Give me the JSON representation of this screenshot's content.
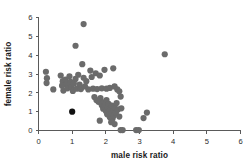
{
  "chart_data": {
    "type": "scatter",
    "title": "",
    "xlabel": "male risk ratio",
    "ylabel": "female risk ratio",
    "xlim": [
      0,
      6
    ],
    "ylim": [
      0,
      6
    ],
    "xticks": [
      0,
      1,
      2,
      3,
      4,
      5,
      6
    ],
    "yticks": [
      0,
      1,
      2,
      3,
      4,
      5,
      6
    ],
    "xtick_labels": [
      "0",
      "1",
      "2",
      "3",
      "4",
      "5",
      "6"
    ],
    "ytick_labels": [
      "0",
      "1",
      "2",
      "3",
      "4",
      "5",
      "6"
    ],
    "grid": false,
    "legend": null,
    "marker_color": "#6b6b6b",
    "highlight_color": "#111111",
    "marker_size": 3.1,
    "axis_color": "#5a5a5a",
    "series": [
      {
        "name": "studies",
        "color": "#6b6b6b",
        "points": [
          [
            0.22,
            3.12
          ],
          [
            0.25,
            2.78
          ],
          [
            0.24,
            2.52
          ],
          [
            0.44,
            2.18
          ],
          [
            0.66,
            2.92
          ],
          [
            0.72,
            2.62
          ],
          [
            0.7,
            2.38
          ],
          [
            0.74,
            2.12
          ],
          [
            0.8,
            2.7
          ],
          [
            0.84,
            2.46
          ],
          [
            0.86,
            2.24
          ],
          [
            0.92,
            2.88
          ],
          [
            0.95,
            2.58
          ],
          [
            0.98,
            2.3
          ],
          [
            1.02,
            2.1
          ],
          [
            1.05,
            2.5
          ],
          [
            1.1,
            2.74
          ],
          [
            1.14,
            2.22
          ],
          [
            1.18,
            2.96
          ],
          [
            1.22,
            2.44
          ],
          [
            1.26,
            2.2
          ],
          [
            1.3,
            3.52
          ],
          [
            1.34,
            2.8
          ],
          [
            1.38,
            2.34
          ],
          [
            1.42,
            2.62
          ],
          [
            1.48,
            2.18
          ],
          [
            1.54,
            3.18
          ],
          [
            1.58,
            2.84
          ],
          [
            1.62,
            2.22
          ],
          [
            1.7,
            3.04
          ],
          [
            1.74,
            2.2
          ],
          [
            1.82,
            2.92
          ],
          [
            1.88,
            2.24
          ],
          [
            1.96,
            3.22
          ],
          [
            2.02,
            2.22
          ],
          [
            2.12,
            2.26
          ],
          [
            2.22,
            3.3
          ],
          [
            2.26,
            2.34
          ],
          [
            2.34,
            2.18
          ],
          [
            2.4,
            2.08
          ],
          [
            1.66,
            1.78
          ],
          [
            1.72,
            1.62
          ],
          [
            1.78,
            1.52
          ],
          [
            1.84,
            1.72
          ],
          [
            1.88,
            1.34
          ],
          [
            1.92,
            1.16
          ],
          [
            1.94,
            1.5
          ],
          [
            1.98,
            1.3
          ],
          [
            2.0,
            1.04
          ],
          [
            2.02,
            1.62
          ],
          [
            2.04,
            0.86
          ],
          [
            2.06,
            1.22
          ],
          [
            2.08,
            1.42
          ],
          [
            2.1,
            0.96
          ],
          [
            2.12,
            0.7
          ],
          [
            2.14,
            1.1
          ],
          [
            2.16,
            0.88
          ],
          [
            2.18,
            1.32
          ],
          [
            2.2,
            0.62
          ],
          [
            2.22,
            1.02
          ],
          [
            2.24,
            0.8
          ],
          [
            2.26,
            1.2
          ],
          [
            2.3,
            0.94
          ],
          [
            2.32,
            1.46
          ],
          [
            2.36,
            1.12
          ],
          [
            2.4,
            0.74
          ],
          [
            1.82,
            0.52
          ],
          [
            2.16,
            0.44
          ],
          [
            2.26,
            0.34
          ],
          [
            2.44,
            1.8
          ],
          [
            2.46,
            1.18
          ],
          [
            2.44,
            0.02
          ],
          [
            2.5,
            0.02
          ],
          [
            2.9,
            0.02
          ],
          [
            2.98,
            0.02
          ],
          [
            3.12,
            0.66
          ],
          [
            3.22,
            0.95
          ],
          [
            1.1,
            4.5
          ],
          [
            1.34,
            5.65
          ],
          [
            3.75,
            4.05
          ]
        ]
      },
      {
        "name": "highlighted study",
        "color": "#111111",
        "points": [
          [
            1.0,
            1.0
          ]
        ]
      }
    ]
  }
}
